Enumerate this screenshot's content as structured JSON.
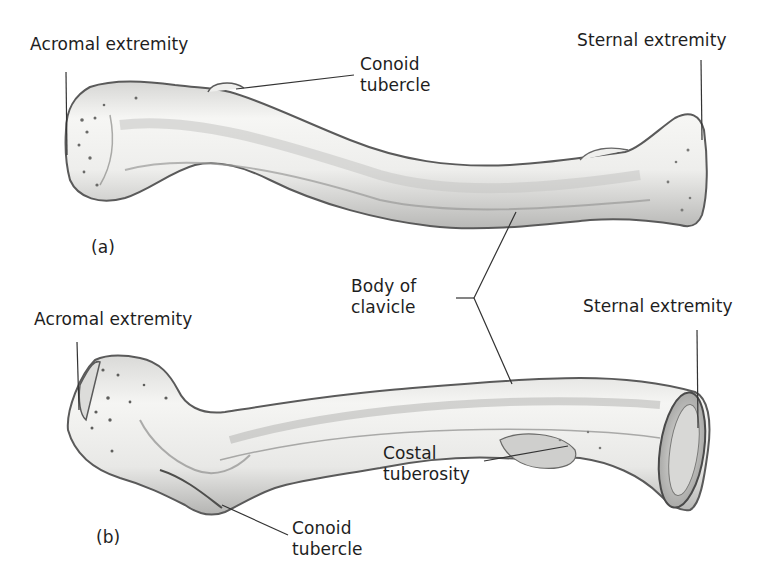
{
  "figure": {
    "subject": "Clavicle",
    "panels": [
      {
        "id": "a",
        "caption": "(a)",
        "labels": {
          "acromal_extremity": "Acromal extremity",
          "conoid_tubercle": [
            "Conoid",
            "tubercle"
          ],
          "sternal_extremity": "Sternal extremity"
        }
      },
      {
        "id": "b",
        "caption": "(b)",
        "labels": {
          "acromal_extremity": "Acromal extremity",
          "sternal_extremity": "Sternal extremity",
          "costal_tuberosity": [
            "Costal",
            "tuberosity"
          ],
          "conoid_tubercle": [
            "Conoid",
            "tubercle"
          ]
        }
      }
    ],
    "shared_labels": {
      "body_of_clavicle": [
        "Body of",
        "clavicle"
      ]
    },
    "colors": {
      "background": "#ffffff",
      "bone_fill": "#f1f1ef",
      "bone_shade": "#bdbdbb",
      "outline": "#4a4a4a",
      "leader_line": "#333333",
      "text": "#1e1e1e"
    }
  }
}
